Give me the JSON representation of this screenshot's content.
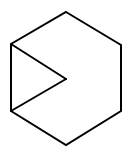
{
  "figure": {
    "width": 128,
    "height": 157,
    "background": "#ffffff",
    "stroke_color": "#000000",
    "stroke_width": 2,
    "hexagon": {
      "vertices": [
        [
          66,
          12
        ],
        [
          121,
          45
        ],
        [
          121,
          111
        ],
        [
          66,
          145
        ],
        [
          11,
          111
        ],
        [
          11,
          44
        ]
      ]
    },
    "inner_lines": [
      {
        "from": [
          11,
          44
        ],
        "to": [
          66,
          79
        ]
      },
      {
        "from": [
          66,
          79
        ],
        "to": [
          11,
          111
        ]
      }
    ]
  }
}
